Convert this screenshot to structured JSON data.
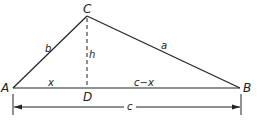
{
  "diagram": {
    "type": "triangle-with-altitude",
    "vertices": {
      "A": {
        "label": "A"
      },
      "B": {
        "label": "B"
      },
      "C": {
        "label": "C"
      },
      "D": {
        "label": "D"
      }
    },
    "sides": {
      "a": "a",
      "b": "b",
      "h": "h",
      "x": "x",
      "c_minus_x": "c−x",
      "c": "c"
    },
    "colors": {
      "line": "#222222",
      "background": "#ffffff"
    }
  }
}
